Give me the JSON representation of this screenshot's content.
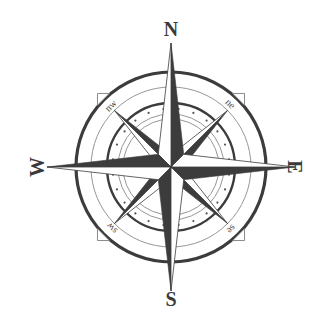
{
  "figure": {
    "type": "compass-rose",
    "center": {
      "x": 171,
      "y": 167
    },
    "colors": {
      "ink_dark": "#3c3c3c",
      "ink_mid": "#555555",
      "ink_light": "#8a8a8a",
      "fill_light": "#ffffff",
      "background": "#ffffff"
    },
    "cardinal_labels": {
      "north": "N",
      "east": "E",
      "south": "S",
      "west": "W"
    },
    "intercardinal_labels": {
      "northeast": "ne",
      "southeast": "se",
      "southwest": "sw",
      "northwest": "nw"
    },
    "rings": [
      {
        "name": "outer-thick-ring",
        "radius": 95,
        "stroke_width": 3.2
      },
      {
        "name": "outer-thin-ring",
        "radius": 80,
        "stroke_width": 0.9
      },
      {
        "name": "dotted-band-outer",
        "radius": 64,
        "stroke_width": 2.4
      },
      {
        "name": "dotted-band-inner",
        "radius": 53,
        "stroke_width": 0.9
      },
      {
        "name": "inner-thin-ring",
        "radius": 48,
        "stroke_width": 0.9
      }
    ],
    "dot_ring_radius": 58.5,
    "dot_count": 24
  }
}
